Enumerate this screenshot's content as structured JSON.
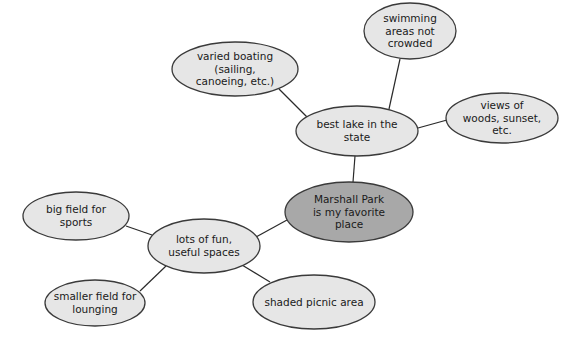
{
  "diagram": {
    "type": "concept-web",
    "colors": {
      "background": "#ffffff",
      "node_fill": "#e6e6e6",
      "center_fill": "#a8a8a8",
      "stroke": "#3a3a3a",
      "edge": "#2a2a2a"
    },
    "nodes": [
      {
        "id": "center",
        "lines": [
          "Marshall Park",
          "is my favorite",
          "place"
        ],
        "cx": 349,
        "cy": 212,
        "rx": 64,
        "ry": 30,
        "central": true
      },
      {
        "id": "lake",
        "lines": [
          "best lake in the",
          "state"
        ],
        "cx": 357,
        "cy": 131,
        "rx": 61,
        "ry": 25
      },
      {
        "id": "boating",
        "lines": [
          "varied boating",
          "(sailing,",
          "canoeing, etc.)"
        ],
        "cx": 235,
        "cy": 69,
        "rx": 63,
        "ry": 27
      },
      {
        "id": "swimming",
        "lines": [
          "swimming",
          "areas not",
          "crowded"
        ],
        "cx": 410,
        "cy": 31,
        "rx": 46,
        "ry": 28
      },
      {
        "id": "views",
        "lines": [
          "views of",
          "woods, sunset,",
          "etc."
        ],
        "cx": 502,
        "cy": 118,
        "rx": 56,
        "ry": 25
      },
      {
        "id": "spaces",
        "lines": [
          "lots of fun,",
          "useful spaces"
        ],
        "cx": 204,
        "cy": 246,
        "rx": 56,
        "ry": 27
      },
      {
        "id": "bigfield",
        "lines": [
          "big field for",
          "sports"
        ],
        "cx": 76,
        "cy": 216,
        "rx": 53,
        "ry": 24
      },
      {
        "id": "smallfield",
        "lines": [
          "smaller field for",
          "lounging"
        ],
        "cx": 95,
        "cy": 303,
        "rx": 50,
        "ry": 23
      },
      {
        "id": "picnic",
        "lines": [
          "shaded picnic area"
        ],
        "cx": 314,
        "cy": 302,
        "rx": 61,
        "ry": 27
      }
    ],
    "edges": [
      {
        "from": "center",
        "to": "lake",
        "x1": 353,
        "y1": 182,
        "x2": 355,
        "y2": 156
      },
      {
        "from": "lake",
        "to": "boating",
        "x1": 307,
        "y1": 117,
        "x2": 279,
        "y2": 89
      },
      {
        "from": "lake",
        "to": "swimming",
        "x1": 389,
        "y1": 109,
        "x2": 400,
        "y2": 59
      },
      {
        "from": "lake",
        "to": "views",
        "x1": 418,
        "y1": 128,
        "x2": 447,
        "y2": 120
      },
      {
        "from": "center",
        "to": "spaces",
        "x1": 287,
        "y1": 220,
        "x2": 256,
        "y2": 237
      },
      {
        "from": "spaces",
        "to": "bigfield",
        "x1": 152,
        "y1": 235,
        "x2": 126,
        "y2": 226
      },
      {
        "from": "spaces",
        "to": "smallfield",
        "x1": 166,
        "y1": 266,
        "x2": 140,
        "y2": 291
      },
      {
        "from": "spaces",
        "to": "picnic",
        "x1": 242,
        "y1": 265,
        "x2": 270,
        "y2": 282
      }
    ]
  }
}
